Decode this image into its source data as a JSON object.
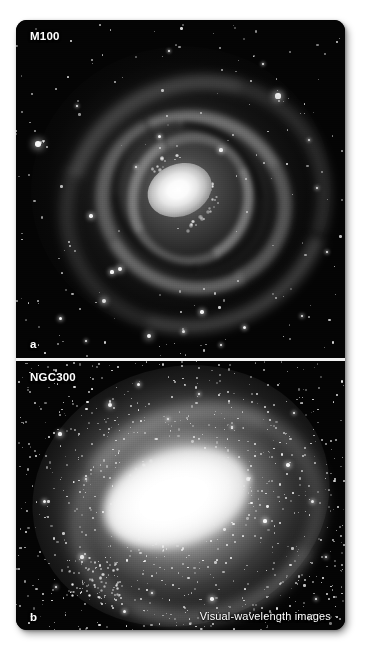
{
  "figure": {
    "background_color": "#ffffff",
    "plate_background": "#050505",
    "divider_color": "#f2f2f2",
    "label_color": "#ffffff"
  },
  "panels": [
    {
      "key": "a",
      "panel_letter": "a",
      "object_name": "M100",
      "object_type": "grand-design spiral galaxy",
      "description": "Visual-wavelength image of the spiral galaxy M100 showing a bright nucleus, two prominent spiral arms studded with bright star-forming knots, and dark dust lanes against a black sky with foreground stars."
    },
    {
      "key": "b",
      "panel_letter": "b",
      "object_name": "NGC300",
      "object_type": "spiral galaxy",
      "description": "Visual-wavelength image of the spiral galaxy NGC300 with an overexposed bright central region, diffuse loosely-wound arms and a dense field of resolved stars."
    }
  ],
  "caption": {
    "bottom_right": "Visual-wavelength images"
  },
  "labels": {
    "m100": "M100",
    "ngc300": "NGC300",
    "panel_a": "a",
    "panel_b": "b"
  }
}
